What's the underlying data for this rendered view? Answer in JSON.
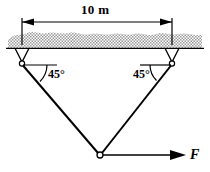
{
  "figure": {
    "dimension": {
      "label": "10 m",
      "value": 10,
      "unit": "m"
    },
    "angles": {
      "left": "45°",
      "right": "45°",
      "value": 45,
      "unit": "deg"
    },
    "force": {
      "label": "F",
      "direction": "horizontal-right"
    },
    "colors": {
      "line": "#000000",
      "hatch": "#b5b5b5",
      "background": "#ffffff",
      "pin_fill": "#ffffff"
    },
    "geometry": {
      "ceiling_y": 48,
      "left_support_x": 22,
      "right_support_x": 172,
      "apex_x": 100,
      "apex_y": 155
    }
  }
}
